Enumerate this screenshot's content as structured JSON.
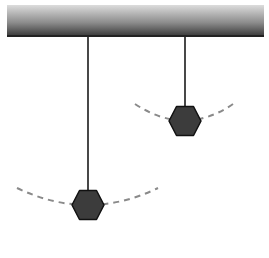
{
  "diagram": {
    "type": "pendulum-comparison",
    "support_bar": {
      "x": 7,
      "y": 5,
      "width": 257,
      "height": 32,
      "color_top": "#d9d9d9",
      "color_bottom": "#3a3a3a"
    },
    "pendulums": [
      {
        "name": "long-pendulum",
        "pivot": [
          88,
          37
        ],
        "bob_center": [
          88,
          205
        ],
        "bob_radius": 15,
        "string_length": 168,
        "arc": {
          "left": [
            17,
            188
          ],
          "right": [
            158,
            188
          ]
        }
      },
      {
        "name": "short-pendulum",
        "pivot": [
          185,
          37
        ],
        "bob_center": [
          185,
          121
        ],
        "bob_radius": 15,
        "string_length": 84,
        "arc": {
          "left": [
            135,
            104
          ],
          "right": [
            233,
            104
          ]
        }
      }
    ],
    "colors": {
      "string": "#1a1a1a",
      "bob_fill": "#3c3c3c",
      "bob_stroke": "#111111",
      "arc": "#8a8a8a"
    }
  }
}
